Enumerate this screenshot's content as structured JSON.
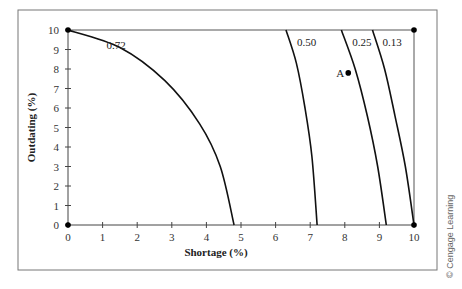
{
  "chart_data": {
    "type": "line",
    "title": "",
    "xlabel": "Shortage (%)",
    "ylabel": "Outdating (%)",
    "xlim": [
      0,
      10
    ],
    "ylim": [
      0,
      10
    ],
    "xticks": [
      "0",
      "1",
      "2",
      "3",
      "4",
      "5",
      "6",
      "7",
      "8",
      "9",
      "10"
    ],
    "yticks": [
      "0",
      "1",
      "2",
      "3",
      "4",
      "5",
      "6",
      "7",
      "8",
      "9",
      "10"
    ],
    "grid": false,
    "series": [
      {
        "name": "0.72",
        "points": [
          [
            0,
            10
          ],
          [
            1.5,
            9.1
          ],
          [
            2.8,
            7.4
          ],
          [
            3.8,
            5.2
          ],
          [
            4.4,
            3.0
          ],
          [
            4.8,
            0
          ]
        ]
      },
      {
        "name": "0.50",
        "points": [
          [
            6.3,
            10
          ],
          [
            6.6,
            8.3
          ],
          [
            6.85,
            6.0
          ],
          [
            7.05,
            3.5
          ],
          [
            7.2,
            0
          ]
        ]
      },
      {
        "name": "0.25",
        "points": [
          [
            7.9,
            10
          ],
          [
            8.3,
            8.0
          ],
          [
            8.65,
            5.6
          ],
          [
            8.95,
            3.0
          ],
          [
            9.2,
            0
          ]
        ]
      },
      {
        "name": "0.13",
        "points": [
          [
            8.8,
            10
          ],
          [
            9.15,
            8.0
          ],
          [
            9.45,
            5.6
          ],
          [
            9.75,
            3.0
          ],
          [
            10,
            0
          ]
        ]
      }
    ],
    "markers": [
      {
        "label": "",
        "x": 0,
        "y": 10
      },
      {
        "label": "",
        "x": 0,
        "y": 0
      },
      {
        "label": "",
        "x": 10,
        "y": 0
      },
      {
        "label": "",
        "x": 10,
        "y": 10
      },
      {
        "label": "A",
        "x": 8.1,
        "y": 7.8
      }
    ],
    "reference_lines": [
      {
        "from": [
          0,
          10
        ],
        "to": [
          10,
          10
        ]
      },
      {
        "from": [
          10,
          10
        ],
        "to": [
          10,
          0
        ]
      }
    ]
  },
  "credit": "© Cengage Learning"
}
